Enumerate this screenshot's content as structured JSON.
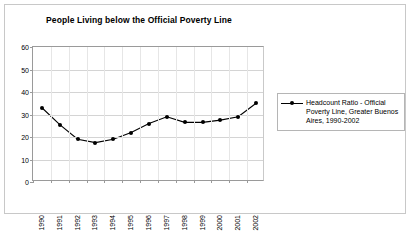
{
  "chart_data": {
    "type": "line",
    "title": "People Living below the Official Poverty Line",
    "xlabel": "",
    "ylabel": "",
    "ylim": [
      0,
      60
    ],
    "yticks": [
      0,
      10,
      20,
      30,
      40,
      50,
      60
    ],
    "grid": true,
    "legend_position": "right",
    "categories": [
      "1990",
      "1991",
      "1992",
      "1993",
      "1994",
      "1995",
      "1996",
      "1997",
      "1998",
      "1999",
      "2000",
      "2001",
      "2002"
    ],
    "series": [
      {
        "name": "Headcount Ratio - Official Poverty Line, Greater Buenos Aires, 1990-2002",
        "marker": "filled-diamond",
        "color": "#000000",
        "values": [
          33.0,
          25.5,
          19.0,
          17.5,
          19.0,
          22.0,
          26.0,
          29.0,
          26.5,
          26.5,
          27.5,
          29.0,
          35.0
        ]
      }
    ]
  },
  "legend": {
    "entries": [
      {
        "marker_icon": "line-with-diamond-marker-icon",
        "line1": "Headcount Ratio - Official",
        "line2": "Poverty Line, Greater Buenos",
        "line3": "Aires, 1990-2002"
      }
    ]
  }
}
